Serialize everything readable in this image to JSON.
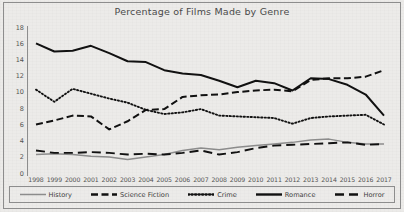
{
  "chart_data": {
    "type": "line",
    "title": "Percentage of Films Made by Genre",
    "xlabel": "",
    "ylabel": "",
    "ylim": [
      0,
      18
    ],
    "ytick_step": 2,
    "yticks": [
      18,
      16,
      14,
      12,
      10,
      8,
      6,
      4,
      2,
      0
    ],
    "grid": false,
    "legend_position": "bottom",
    "x": [
      1998,
      1999,
      2000,
      2001,
      2002,
      2003,
      2004,
      2005,
      2006,
      2007,
      2008,
      2009,
      2010,
      2011,
      2012,
      2013,
      2014,
      2015,
      2016,
      2017
    ],
    "categories": [
      "1998",
      "1999",
      "2000",
      "2001",
      "2002",
      "2003",
      "2004",
      "2005",
      "2006",
      "2007",
      "2008",
      "2009",
      "2010",
      "2011",
      "2012",
      "2013",
      "2014",
      "2015",
      "2016",
      "2017"
    ],
    "series": [
      {
        "name": "History",
        "style": "solid-thin",
        "color": "#8c8c8c",
        "values": [
          2.4,
          2.5,
          2.4,
          2.2,
          2.1,
          1.8,
          2.1,
          2.4,
          2.9,
          3.2,
          3.0,
          3.3,
          3.5,
          3.7,
          3.9,
          4.2,
          4.3,
          3.9,
          3.7,
          3.7
        ]
      },
      {
        "name": "Science Fiction",
        "style": "dashed-thick",
        "color": "#111111",
        "values": [
          6.1,
          6.6,
          7.2,
          7.1,
          5.5,
          6.5,
          7.9,
          8.0,
          9.5,
          9.7,
          9.8,
          10.1,
          10.3,
          10.4,
          10.2,
          11.6,
          11.8,
          11.8,
          12.0,
          12.8
        ]
      },
      {
        "name": "Crime",
        "style": "dotted",
        "color": "#111111",
        "values": [
          10.4,
          8.9,
          10.5,
          9.9,
          9.3,
          8.8,
          7.9,
          7.4,
          7.6,
          8.0,
          7.2,
          7.1,
          7.0,
          6.9,
          6.2,
          6.9,
          7.1,
          7.2,
          7.3,
          6.1
        ]
      },
      {
        "name": "Romance",
        "style": "solid-thick",
        "color": "#111111",
        "values": [
          16.1,
          15.1,
          15.2,
          15.8,
          14.9,
          13.9,
          13.8,
          12.8,
          12.4,
          12.2,
          11.5,
          10.7,
          11.5,
          11.2,
          10.3,
          11.8,
          11.7,
          11.0,
          9.8,
          7.2
        ]
      },
      {
        "name": "Horror",
        "style": "longdash",
        "color": "#111111",
        "values": [
          2.9,
          2.6,
          2.6,
          2.7,
          2.6,
          2.4,
          2.5,
          2.4,
          2.6,
          2.9,
          2.4,
          2.7,
          3.2,
          3.5,
          3.6,
          3.7,
          3.8,
          3.9,
          3.6,
          3.7
        ]
      }
    ]
  },
  "legend": {
    "items": [
      {
        "label": "History"
      },
      {
        "label": "Science Fiction"
      },
      {
        "label": "Crime"
      },
      {
        "label": "Romance"
      },
      {
        "label": "Horror"
      }
    ]
  }
}
